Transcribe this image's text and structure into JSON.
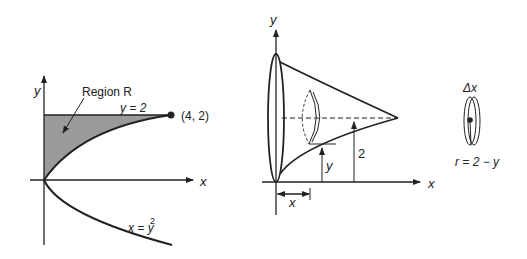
{
  "left_figure": {
    "axis_x_label": "x",
    "axis_y_label": "y",
    "region_label": "Region R",
    "line_label": "y = 2",
    "point_label": "(4, 2)",
    "curve_label": "x = y",
    "curve_exponent": "2",
    "fill_color": "#9a9a9a"
  },
  "middle_figure": {
    "axis_x_label": "x",
    "axis_y_label": "y",
    "height_label": "2",
    "y_dim_label": "y",
    "x_dim_label": "x"
  },
  "right_figure": {
    "thickness_label": "Δx",
    "radius_label": "r = 2 − y"
  }
}
